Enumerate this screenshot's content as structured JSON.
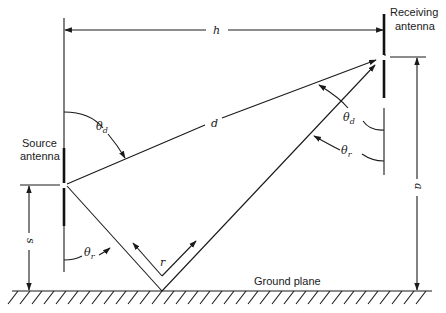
{
  "diagram": {
    "type": "antenna-ground-reflection-geometry",
    "labels": {
      "source_antenna": [
        "Source",
        "antenna"
      ],
      "receiving_antenna": [
        "Receiving",
        "antenna"
      ],
      "ground_plane": "Ground plane",
      "horizontal_distance": "h",
      "direct_path": "d",
      "reflected_path": "r",
      "receiver_height": "a",
      "source_height": "s",
      "theta_d_symbol": "θ",
      "theta_d_sub": "d",
      "theta_r_symbol": "θ",
      "theta_r_sub": "r"
    },
    "components": [
      {
        "id": "source-antenna",
        "description": "Vertical antenna at left, height s above ground"
      },
      {
        "id": "receiving-antenna",
        "description": "Vertical antenna at right, height a above ground"
      },
      {
        "id": "direct-ray",
        "description": "Direct path d from source to receiver at angle θd"
      },
      {
        "id": "reflected-ray",
        "description": "Reflected path r bouncing off ground plane at angle θr"
      },
      {
        "id": "ground-plane",
        "description": "Hatched ground surface"
      }
    ],
    "colors": {
      "stroke": "#1a1a1a",
      "background": "#ffffff"
    }
  }
}
